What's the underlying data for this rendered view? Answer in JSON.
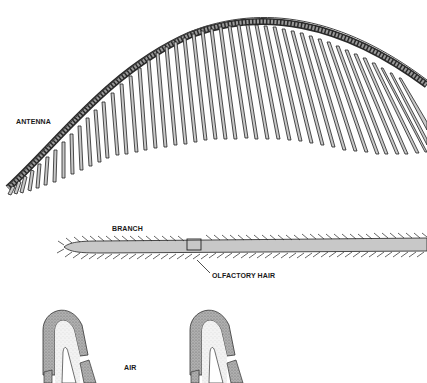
{
  "diagram": {
    "panels": [
      {
        "id": "antenna",
        "label": "ANTENNA"
      },
      {
        "id": "branch",
        "label": "BRANCH",
        "callout": "OLFACTORY HAIR"
      },
      {
        "id": "hair-cross-section",
        "label": "AIR"
      }
    ]
  },
  "labels": {
    "antenna": "ANTENNA",
    "branch": "BRANCH",
    "olfactory_hair": "OLFACTORY HAIR",
    "air": "AIR"
  },
  "colors": {
    "ink": "#1a1a1a",
    "fill_gray": "#c8c8c8",
    "stipple_dark": "#9a9a9a",
    "stipple_light": "#e4e4e4"
  }
}
